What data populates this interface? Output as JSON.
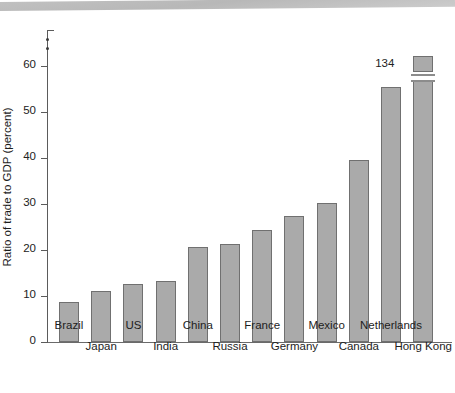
{
  "chart_data": {
    "type": "bar",
    "title": "",
    "xlabel": "",
    "ylabel": "Ratio of trade to GDP (percent)",
    "ylim": [
      0,
      68
    ],
    "yticks": [
      0,
      10,
      20,
      30,
      40,
      50,
      60
    ],
    "ytick_labels": [
      "0",
      "10",
      "20",
      "30",
      "40",
      "50",
      "60"
    ],
    "grid": false,
    "legend": null,
    "axis_break": {
      "present": true,
      "axis": "y",
      "note": "y-axis broken above 60; Hong Kong bar drawn with a break and its true value annotated"
    },
    "categories": [
      "Brazil",
      "Japan",
      "US",
      "India",
      "China",
      "Russia",
      "France",
      "Germany",
      "Mexico",
      "Canada",
      "Netherlands",
      "Hong Kong"
    ],
    "values": [
      8.7,
      11.0,
      12.6,
      13.3,
      20.7,
      21.2,
      24.3,
      27.3,
      30.2,
      39.6,
      55.5,
      134
    ],
    "annotations": [
      {
        "category": "Hong Kong",
        "text": "134"
      }
    ],
    "bar_color": "#aaaaaa",
    "bar_edge_color": "#707070",
    "axis_color": "#5b5b5b"
  },
  "labels": {
    "row_top": [
      "Brazil",
      "US",
      "China",
      "France",
      "Mexico",
      "Netherlands"
    ],
    "row_bottom": [
      "Japan",
      "India",
      "Russia",
      "Germany",
      "Canada",
      "Hong Kong"
    ]
  }
}
